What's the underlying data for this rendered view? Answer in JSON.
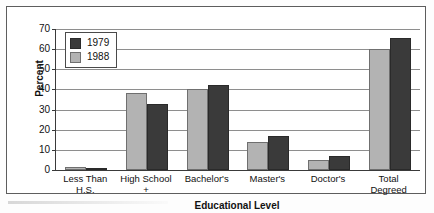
{
  "figure": {
    "background_color": "#ffffff",
    "frame_color": "#5d5d5d"
  },
  "legend": {
    "position": "top-left-inside",
    "entries": [
      {
        "label": "1979",
        "color": "#3a3a3a",
        "swatch_name": "legend-swatch-1979"
      },
      {
        "label": "1988",
        "color": "#b3b3b3",
        "swatch_name": "legend-swatch-1988"
      }
    ]
  },
  "axes": {
    "y_title": "Percent",
    "x_title": "Educational Level",
    "y_ticks": [
      "0",
      "10",
      "20",
      "30",
      "40",
      "50",
      "60",
      "70"
    ],
    "y_min": 0,
    "y_max": 70,
    "grid": true
  },
  "chart_data": {
    "type": "bar",
    "title": "",
    "subtitle": "",
    "xlabel": "Educational Level",
    "ylabel": "Percent",
    "ylim": [
      0,
      70
    ],
    "ytick_step": 10,
    "grid": true,
    "legend_position": "upper left",
    "categories": [
      "Less Than\nH.S.",
      "High School\n+",
      "Bachelor's",
      "Master's",
      "Doctor's",
      "Total\nDegreed"
    ],
    "series": [
      {
        "name": "1988",
        "color": "#b3b3b3",
        "values": [
          1.5,
          38,
          40,
          14,
          5,
          60
        ]
      },
      {
        "name": "1979",
        "color": "#3a3a3a",
        "values": [
          0.7,
          33,
          42,
          17,
          7,
          65.5
        ]
      }
    ]
  }
}
